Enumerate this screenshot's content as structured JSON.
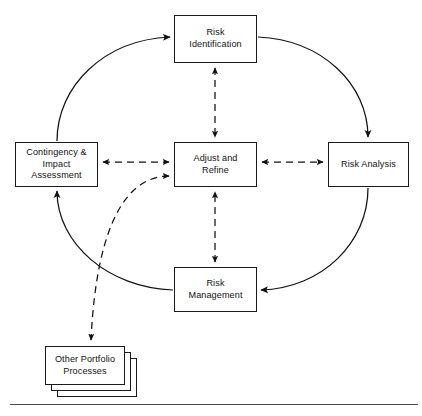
{
  "diagram": {
    "background_color": "#ffffff",
    "line_color": "#1a1a1a",
    "rule_color": "#4a4a4a",
    "nodes": [
      {
        "id": "risk-identification",
        "label": "Risk\nIdentification",
        "x": 174,
        "y": 15,
        "w": 83,
        "h": 48
      },
      {
        "id": "contingency-impact-assessment",
        "label": "Contingency &\nImpact\nAssessment",
        "x": 15,
        "y": 142,
        "w": 83,
        "h": 45
      },
      {
        "id": "adjust-and-refine",
        "label": "Adjust and\nRefine",
        "x": 174,
        "y": 142,
        "w": 83,
        "h": 45
      },
      {
        "id": "risk-analysis",
        "label": "Risk Analysis",
        "x": 328,
        "y": 142,
        "w": 81,
        "h": 45
      },
      {
        "id": "risk-management",
        "label": "Risk\nManagement",
        "x": 174,
        "y": 267,
        "w": 83,
        "h": 45
      },
      {
        "id": "other-portfolio-processes",
        "label": "Other Portfolio\nProcesses",
        "x": 45,
        "y": 346,
        "w": 80,
        "h": 39,
        "stacked": true,
        "stack_count": 3,
        "stack_offset": 6
      }
    ],
    "edges": [
      {
        "id": "contingency-to-identification",
        "from": "contingency-impact-assessment",
        "to": "risk-identification",
        "style": "solid",
        "arrows": "end"
      },
      {
        "id": "identification-to-analysis",
        "from": "risk-identification",
        "to": "risk-analysis",
        "style": "solid",
        "arrows": "end"
      },
      {
        "id": "analysis-to-management",
        "from": "risk-analysis",
        "to": "risk-management",
        "style": "solid",
        "arrows": "end"
      },
      {
        "id": "management-to-contingency",
        "from": "risk-management",
        "to": "contingency-impact-assessment",
        "style": "solid",
        "arrows": "end"
      },
      {
        "id": "identification-adjust",
        "from": "risk-identification",
        "to": "adjust-and-refine",
        "style": "dashed",
        "arrows": "both"
      },
      {
        "id": "contingency-adjust",
        "from": "contingency-impact-assessment",
        "to": "adjust-and-refine",
        "style": "dashed",
        "arrows": "both"
      },
      {
        "id": "adjust-analysis",
        "from": "adjust-and-refine",
        "to": "risk-analysis",
        "style": "dashed",
        "arrows": "both"
      },
      {
        "id": "management-adjust",
        "from": "risk-management",
        "to": "adjust-and-refine",
        "style": "dashed",
        "arrows": "both"
      },
      {
        "id": "adjust-other-portfolio",
        "from": "adjust-and-refine",
        "to": "other-portfolio-processes",
        "style": "dashed",
        "arrows": "both"
      }
    ]
  }
}
